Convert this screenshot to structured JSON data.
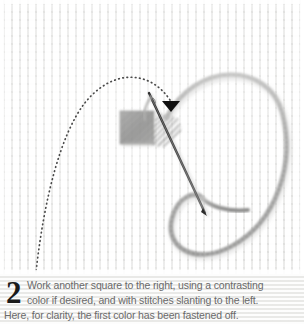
{
  "figure": {
    "type": "embroidery-instruction-illustration",
    "alt_summary": "Needle passing through a thread loop beside a completed grey stitched square on woven canvas, with a dotted guide arrow showing the thread direction."
  },
  "illustration": {
    "cloth_label": "aida-cloth",
    "worked_square_label": "completed-stitch-block",
    "needle_label": "sewing-needle",
    "thread_loop_label": "thread-loop",
    "guide_arrow_label": "dotted-direction-arrow",
    "colors": {
      "cloth_light": "#f7f7f6",
      "cloth_weave": "#d6d6d4",
      "stitch_block": "#9a9a99",
      "stitch_block_dark": "#7f7f7e",
      "thread": "#a9a9a8",
      "needle": "#3a3a3a",
      "guide_dots": "#4a4a4a",
      "arrowhead": "#111111"
    }
  },
  "caption": {
    "step_number": "2",
    "line_1": "Work another square to the right, using a contrasting",
    "line_2": "color if desired, and with stitches slanting to the left.",
    "line_3": "Here, for clarity, the first color has been fastened off.",
    "full_text": "Work another square to the right, using a contrasting color if desired, and with stitches slanting to the left. Here, for clarity, the first color has been fastened off.",
    "text_color": "#6a6a6a",
    "number_color": "#1b1b1b",
    "background_color": "#f2f2f0"
  }
}
